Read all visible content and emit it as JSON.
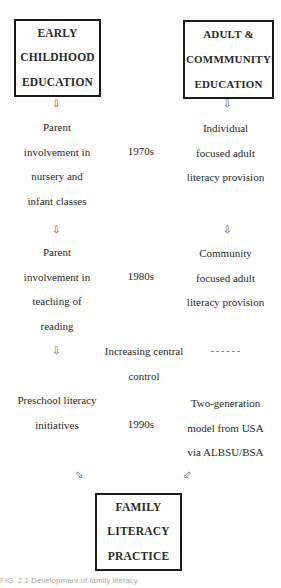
{
  "boxes": {
    "early": {
      "lines": [
        "EARLY",
        "CHILDHOOD",
        "EDUCATION"
      ]
    },
    "adult": {
      "lines": [
        "ADULT &",
        "COMMMUNITY",
        "EDUCATION"
      ]
    },
    "family": {
      "lines": [
        "FAMILY",
        "LITERACY",
        "PRACTICE"
      ]
    }
  },
  "left": {
    "item1": [
      "Parent",
      "involvement in",
      "nursery and",
      "infant classes"
    ],
    "item2": [
      "Parent",
      "involvement in",
      "teaching of",
      "reading"
    ],
    "item3": [
      "Preschool literacy",
      "initiatives"
    ]
  },
  "middle": {
    "decade1": "1970s",
    "decade2": "1980s",
    "central": [
      "Increasing central",
      "control"
    ],
    "decade3": "1990s"
  },
  "right": {
    "item1": [
      "Individual",
      "focused adult",
      "literacy provision"
    ],
    "item2": [
      "Community",
      "focused adult",
      "literacy provision"
    ],
    "dashes": "- - - - - -",
    "item3": [
      "Two-generation",
      "model from USA",
      "via ALBSU/BSA"
    ]
  },
  "icons": {
    "down_arrow": "⇩",
    "diag_right": "⬂",
    "diag_left": "⬃"
  },
  "caption": "FIG. 2.1   Development of family literacy"
}
